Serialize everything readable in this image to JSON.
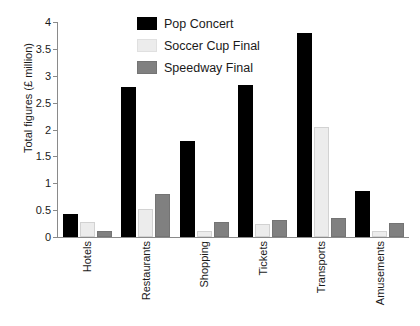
{
  "chart_data": {
    "type": "bar",
    "title": "",
    "xlabel": "",
    "ylabel": "Total figures (£ million)",
    "ylim": [
      0,
      4
    ],
    "ytick_labels": [
      "4",
      "3.5",
      "3",
      "2.5",
      "2",
      "1.5",
      "1",
      "0.5",
      "0"
    ],
    "ytick_values": [
      4,
      3.5,
      3,
      2.5,
      2,
      1.5,
      1,
      0.5,
      0
    ],
    "grid": false,
    "legend_position": "top-center",
    "categories": [
      "Hotels",
      "Restaurants",
      "Shopping",
      "Tickets",
      "Transports",
      "Amusements"
    ],
    "series": [
      {
        "name": "Pop Concert",
        "color": "#000000",
        "values": [
          0.42,
          2.8,
          1.78,
          2.82,
          3.8,
          0.85
        ]
      },
      {
        "name": "Soccer Cup Final",
        "color": "#ececec",
        "values": [
          0.28,
          0.52,
          0.12,
          0.25,
          2.05,
          0.12
        ]
      },
      {
        "name": "Speedway Final",
        "color": "#808080",
        "values": [
          0.12,
          0.8,
          0.28,
          0.32,
          0.35,
          0.26
        ]
      }
    ]
  }
}
